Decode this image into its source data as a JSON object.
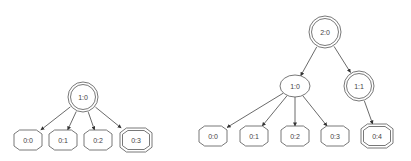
{
  "trees": [
    {
      "nodes": [
        {
          "id": "L10",
          "label": "1:0",
          "shape": "doublecircle",
          "x": 83,
          "y": 97,
          "r": 15
        },
        {
          "id": "L00",
          "label": "0:0",
          "shape": "octagon",
          "x": 28,
          "y": 140
        },
        {
          "id": "L01",
          "label": "0:1",
          "shape": "octagon",
          "x": 63,
          "y": 140
        },
        {
          "id": "L02",
          "label": "0:2",
          "shape": "octagon",
          "x": 98,
          "y": 140
        },
        {
          "id": "L03",
          "label": "0:3",
          "shape": "doubleoctagon",
          "x": 136,
          "y": 140
        }
      ],
      "edges": [
        [
          "L10",
          "L00"
        ],
        [
          "L10",
          "L01"
        ],
        [
          "L10",
          "L02"
        ],
        [
          "L10",
          "L03"
        ]
      ]
    },
    {
      "nodes": [
        {
          "id": "R20",
          "label": "2:0",
          "shape": "doublecircle",
          "x": 325,
          "y": 32,
          "r": 16
        },
        {
          "id": "R10",
          "label": "1:0",
          "shape": "ellipse",
          "x": 295,
          "y": 86,
          "rx": 15,
          "ry": 11
        },
        {
          "id": "R11",
          "label": "1:1",
          "shape": "doublecircle",
          "x": 359,
          "y": 86,
          "r": 15
        },
        {
          "id": "R00",
          "label": "0:0",
          "shape": "octagon",
          "x": 213,
          "y": 136
        },
        {
          "id": "R01",
          "label": "0:1",
          "shape": "octagon",
          "x": 254,
          "y": 136
        },
        {
          "id": "R02",
          "label": "0:2",
          "shape": "octagon",
          "x": 295,
          "y": 136
        },
        {
          "id": "R03",
          "label": "0:3",
          "shape": "octagon",
          "x": 335,
          "y": 136
        },
        {
          "id": "R04",
          "label": "0:4",
          "shape": "doubleoctagon",
          "x": 377,
          "y": 136
        }
      ],
      "edges": [
        [
          "R20",
          "R10"
        ],
        [
          "R20",
          "R11"
        ],
        [
          "R10",
          "R00"
        ],
        [
          "R10",
          "R01"
        ],
        [
          "R10",
          "R02"
        ],
        [
          "R10",
          "R03"
        ],
        [
          "R11",
          "R04"
        ]
      ]
    }
  ],
  "colors": {
    "stroke": "#555555",
    "text": "#444444",
    "background": "#ffffff"
  }
}
